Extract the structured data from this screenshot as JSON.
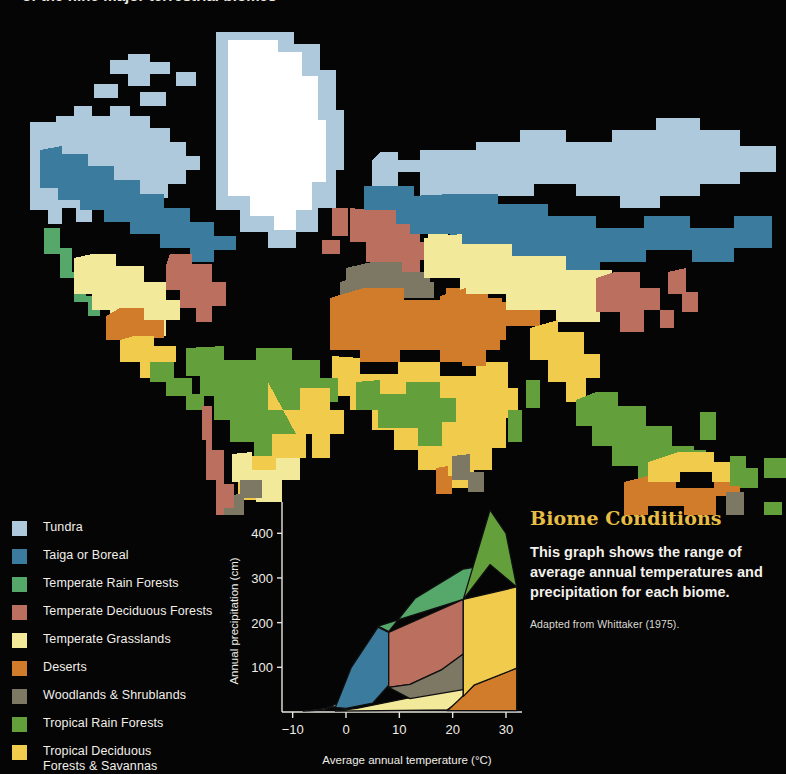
{
  "page": {
    "background": "#050505",
    "cropped_headline": "of the nine major terrestrial biomes"
  },
  "legend": {
    "items": [
      {
        "label": "Tundra",
        "color": "#aec9dc"
      },
      {
        "label": "Taiga or Boreal",
        "color": "#3b7c9e"
      },
      {
        "label": "Temperate Rain Forests",
        "color": "#56a86a"
      },
      {
        "label": "Temperate Deciduous Forests",
        "color": "#bb6f5e"
      },
      {
        "label": "Temperate Grasslands",
        "color": "#f2ea9a"
      },
      {
        "label": "Deserts",
        "color": "#d07c2a"
      },
      {
        "label": "Woodlands & Shrublands",
        "color": "#7c7864"
      },
      {
        "label": "Tropical Rain Forests",
        "color": "#63a03c"
      },
      {
        "label": "Tropical Deciduous",
        "label_line2": "Forests & Savannas",
        "color": "#f1cb4c"
      }
    ]
  },
  "panel": {
    "title": "Biome Conditions",
    "body": "This graph shows the range of average annual temperatures and precipitation for each biome.",
    "note": "Adapted from Whittaker (1975)."
  },
  "chart_data": {
    "type": "area",
    "title": "Biome Conditions",
    "xlabel": "Average annual temperature (°C)",
    "ylabel": "Annual precipitation (cm)",
    "xlim": [
      -12,
      33
    ],
    "ylim": [
      0,
      470
    ],
    "xticks": [
      -10,
      0,
      10,
      20,
      30
    ],
    "yticks": [
      100,
      200,
      300,
      400
    ],
    "grid": false,
    "legend_position": "external-left",
    "source": "Adapted from Whittaker (1975).",
    "series": [
      {
        "name": "Tundra",
        "color": "#c5dcea",
        "polygon": [
          [
            -8,
            2
          ],
          [
            -4,
            5
          ],
          [
            0,
            30
          ],
          [
            1,
            100
          ],
          [
            0,
            35
          ],
          [
            -2,
            12
          ],
          [
            -5,
            6
          ],
          [
            -8,
            2
          ]
        ]
      },
      {
        "name": "Taiga or Boreal",
        "color": "#3b7c9e",
        "polygon": [
          [
            -2,
            10
          ],
          [
            1,
            100
          ],
          [
            6,
            190
          ],
          [
            8,
            178
          ],
          [
            8,
            60
          ],
          [
            5,
            20
          ],
          [
            0,
            8
          ],
          [
            -2,
            10
          ]
        ]
      },
      {
        "name": "Temperate Rain Forests",
        "color": "#56a86a",
        "polygon": [
          [
            6,
            192
          ],
          [
            22,
            252
          ],
          [
            27,
            330
          ],
          [
            22,
            320
          ],
          [
            13,
            255
          ],
          [
            8,
            180
          ],
          [
            6,
            192
          ]
        ]
      },
      {
        "name": "Temperate Deciduous Forests",
        "color": "#bb6f5e",
        "polygon": [
          [
            8,
            178
          ],
          [
            22,
            252
          ],
          [
            22,
            130
          ],
          [
            18,
            95
          ],
          [
            12,
            62
          ],
          [
            8,
            55
          ],
          [
            8,
            178
          ]
        ]
      },
      {
        "name": "Temperate Grasslands",
        "color": "#f2ea9a",
        "polygon": [
          [
            -2,
            2
          ],
          [
            19,
            5
          ],
          [
            22,
            30
          ],
          [
            22,
            55
          ],
          [
            12,
            32
          ],
          [
            2,
            8
          ],
          [
            -2,
            2
          ]
        ]
      },
      {
        "name": "Deserts",
        "color": "#d07c2a",
        "polygon": [
          [
            19,
            3
          ],
          [
            32,
            3
          ],
          [
            32,
            98
          ],
          [
            24,
            60
          ],
          [
            21,
            25
          ],
          [
            19,
            3
          ]
        ]
      },
      {
        "name": "Woodlands & Shrublands",
        "color": "#7c7864",
        "polygon": [
          [
            8,
            55
          ],
          [
            12,
            62
          ],
          [
            18,
            95
          ],
          [
            22,
            130
          ],
          [
            22,
            50
          ],
          [
            12,
            30
          ],
          [
            8,
            55
          ]
        ]
      },
      {
        "name": "Tropical Rain Forests",
        "color": "#63a03c",
        "polygon": [
          [
            22,
            252
          ],
          [
            27,
            452
          ],
          [
            30,
            400
          ],
          [
            32,
            280
          ],
          [
            27,
            330
          ],
          [
            22,
            252
          ]
        ]
      },
      {
        "name": "Tropical Deciduous Forests & Savannas",
        "color": "#f1cb4c",
        "polygon": [
          [
            22,
            252
          ],
          [
            32,
            280
          ],
          [
            32,
            98
          ],
          [
            24,
            60
          ],
          [
            22,
            35
          ],
          [
            22,
            252
          ]
        ]
      }
    ]
  },
  "map": {
    "title": "World biome distribution map",
    "ocean_color": "#050505",
    "ice_color": "#ffffff",
    "regions": [
      {
        "name": "greenland-ice-sheet",
        "biome": "Ice",
        "color": "#ffffff"
      },
      {
        "name": "arctic-tundra-belt",
        "biome": "Tundra",
        "color": "#aec9dc"
      },
      {
        "name": "boreal-forest-belt",
        "biome": "Taiga or Boreal",
        "color": "#3b7c9e"
      },
      {
        "name": "temperate-rain-forest",
        "biome": "Temperate Rain Forests",
        "color": "#56a86a"
      },
      {
        "name": "temperate-deciduous-forest",
        "biome": "Temperate Deciduous Forests",
        "color": "#bb6f5e"
      },
      {
        "name": "temperate-grassland",
        "biome": "Temperate Grasslands",
        "color": "#f2ea9a"
      },
      {
        "name": "desert",
        "biome": "Deserts",
        "color": "#d07c2a"
      },
      {
        "name": "woodland-shrubland",
        "biome": "Woodlands & Shrublands",
        "color": "#7c7864"
      },
      {
        "name": "tropical-rain-forest",
        "biome": "Tropical Rain Forests",
        "color": "#63a03c"
      },
      {
        "name": "tropical-deciduous-savanna",
        "biome": "Tropical Deciduous Forests & Savannas",
        "color": "#f1cb4c"
      }
    ]
  }
}
